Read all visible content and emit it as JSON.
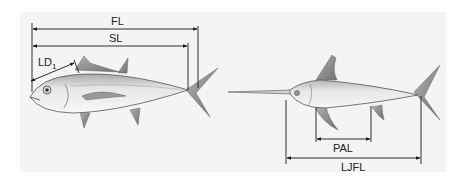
{
  "figure": {
    "background": "#ffffff",
    "panel_color": "#f3f3f3",
    "line_color": "#1a1a1a",
    "fish_fill_light": "#f2f2f2",
    "fish_fill_dark": "#9a9a9a",
    "fin_color": "#8c8c8c"
  },
  "tuna": {
    "name": "tuna",
    "measurements": [
      {
        "id": "FL",
        "label": "FL"
      },
      {
        "id": "SL",
        "label": "SL"
      },
      {
        "id": "LD1",
        "label": "LD",
        "subscript": "1"
      }
    ]
  },
  "swordfish": {
    "name": "swordfish",
    "measurements": [
      {
        "id": "PAL",
        "label": "PAL"
      },
      {
        "id": "LJFL",
        "label": "LJFL"
      }
    ]
  }
}
